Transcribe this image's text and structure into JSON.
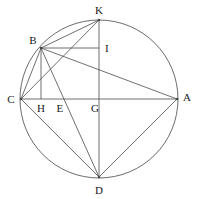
{
  "figure": {
    "type": "geometry-diagram",
    "width": 198,
    "height": 199,
    "background_color": "#ffffff",
    "stroke_color": "#4a4a4a",
    "label_color": "#1a1a1a"
  },
  "circle": {
    "name": "circumcircle",
    "cx": 99,
    "cy": 99,
    "r": 79,
    "stroke": "#5a5a5a"
  },
  "points": [
    {
      "id": "K",
      "label": "K",
      "x": 99,
      "y": 20,
      "label_x": 99,
      "label_y": 10,
      "on_circle": true
    },
    {
      "id": "B",
      "label": "B",
      "x": 41,
      "y": 48,
      "label_x": 33,
      "label_y": 40,
      "on_circle": true
    },
    {
      "id": "I",
      "label": "I",
      "x": 99,
      "y": 48,
      "label_x": 107,
      "label_y": 48,
      "on_circle": false
    },
    {
      "id": "C",
      "label": "C",
      "x": 21,
      "y": 99,
      "label_x": 11,
      "label_y": 99,
      "on_circle": true
    },
    {
      "id": "H",
      "label": "H",
      "x": 41,
      "y": 99,
      "label_x": 41,
      "label_y": 108,
      "on_circle": false
    },
    {
      "id": "E",
      "label": "E",
      "x": 62,
      "y": 99,
      "label_x": 60,
      "label_y": 108,
      "on_circle": false
    },
    {
      "id": "G",
      "label": "G",
      "x": 99,
      "y": 99,
      "label_x": 95,
      "label_y": 108,
      "on_circle": false
    },
    {
      "id": "A",
      "label": "A",
      "x": 177,
      "y": 99,
      "label_x": 187,
      "label_y": 97,
      "on_circle": true
    },
    {
      "id": "D",
      "label": "D",
      "x": 99,
      "y": 177,
      "label_x": 99,
      "label_y": 190,
      "on_circle": true
    }
  ],
  "segments": [
    {
      "id": "CA",
      "from": "C",
      "to": "A",
      "note": "horizontal diameter chord"
    },
    {
      "id": "KD",
      "from": "K",
      "to": "D",
      "note": "vertical diameter chord"
    },
    {
      "id": "BI",
      "from": "B",
      "to": "I",
      "note": "horizontal segment from B to KD"
    },
    {
      "id": "BH",
      "from": "B",
      "to": "H",
      "note": "vertical perpendicular from B to CA"
    },
    {
      "id": "BK",
      "from": "B",
      "to": "K"
    },
    {
      "id": "BC",
      "from": "B",
      "to": "C"
    },
    {
      "id": "BA",
      "from": "B",
      "to": "A"
    },
    {
      "id": "BD",
      "from": "B",
      "to": "D",
      "note": "passes through E"
    },
    {
      "id": "CK",
      "from": "C",
      "to": "K"
    },
    {
      "id": "CD",
      "from": "C",
      "to": "D"
    },
    {
      "id": "DA",
      "from": "D",
      "to": "A"
    }
  ]
}
